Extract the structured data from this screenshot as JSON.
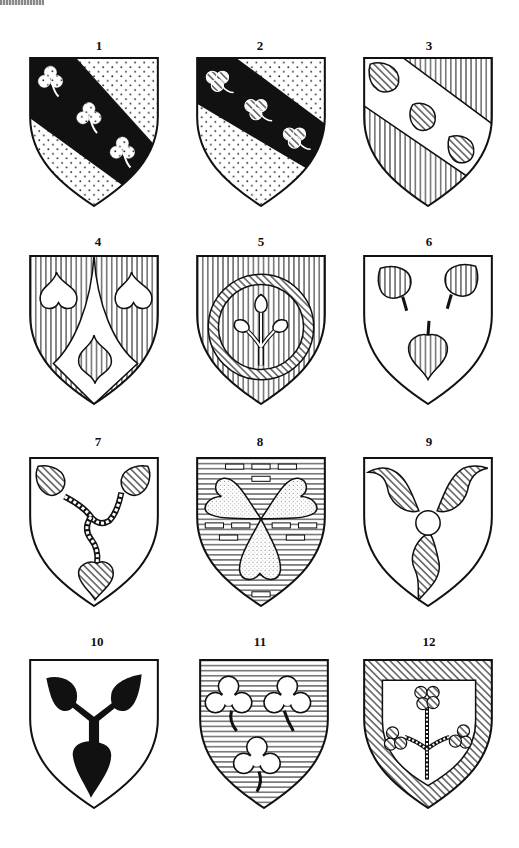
{
  "figure": {
    "shields": [
      {
        "number": "1",
        "field": "dotted",
        "ordinary": "bend sable",
        "charges": "three trefoils slipped, dotted"
      },
      {
        "number": "2",
        "field": "dotted",
        "ordinary": "bend sable",
        "charges": "three trefoils slipped, hatched"
      },
      {
        "number": "3",
        "field": "vertical lines",
        "ordinary": "bend plain",
        "charges": "three leaves, hatched"
      },
      {
        "number": "4",
        "field": "vertical lines",
        "ordinary": "chape / pile reversed plain",
        "charges": "three leaves"
      },
      {
        "number": "5",
        "field": "vertical lines",
        "ordinary": "annulet hatched",
        "charges": "sprig of three leaves"
      },
      {
        "number": "6",
        "field": "plain",
        "ordinary": "none",
        "charges": "three leaves, vertical lines"
      },
      {
        "number": "7",
        "field": "plain",
        "ordinary": "none",
        "charges": "three leaves conjoined by twisted stalks"
      },
      {
        "number": "8",
        "field": "horizontal lines, billetty",
        "ordinary": "none",
        "charges": "three hearts conjoined, dotted"
      },
      {
        "number": "9",
        "field": "plain",
        "ordinary": "none",
        "charges": "three leaves around a roundel, hatched"
      },
      {
        "number": "10",
        "field": "plain",
        "ordinary": "none",
        "charges": "three leaves conjoined, sable"
      },
      {
        "number": "11",
        "field": "horizontal lines",
        "ordinary": "none",
        "charges": "three trefoils slipped, plain"
      },
      {
        "number": "12",
        "field": "plain",
        "ordinary": "bordure hatched",
        "charges": "sprig of three trefoils, hatched"
      }
    ]
  },
  "colors": {
    "ink": "#111111",
    "paper": "#ffffff"
  }
}
